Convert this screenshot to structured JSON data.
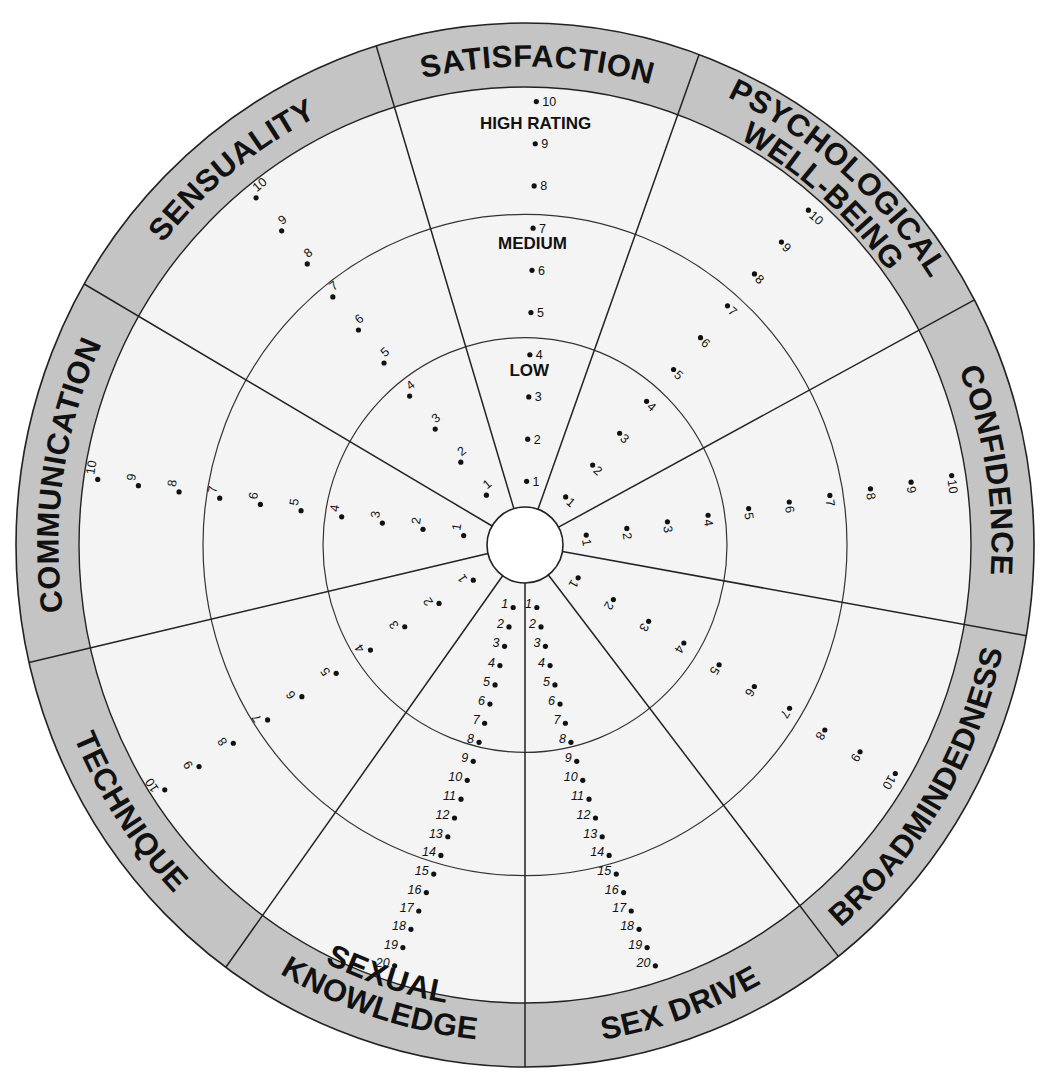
{
  "diagram": {
    "type": "rating-wheel",
    "center": {
      "x": 525,
      "y": 545
    },
    "outer_radius": {
      "rx": 509,
      "ry": 522
    },
    "band_inner_radius": {
      "rx": 446,
      "ry": 458
    },
    "level_radii": {
      "low_medium": 202,
      "medium_high": 322
    },
    "hub_radius": 38,
    "colors": {
      "band": "#c4c4c4",
      "face": "#f4f4f4",
      "lines": "#222222",
      "background": "#ffffff"
    },
    "level_labels": [
      {
        "text": "HIGH RATING",
        "sector": "satisfaction",
        "radius": 405
      },
      {
        "text": "MEDIUM",
        "sector": "satisfaction",
        "radius": 288
      },
      {
        "text": "LOW",
        "sector": "satisfaction",
        "radius": 165
      }
    ],
    "spokes_deg": [
      -17,
      20,
      62,
      100,
      142,
      180,
      216,
      257,
      300
    ],
    "categories": [
      {
        "id": "satisfaction",
        "label": "SATISFACTION",
        "start_deg": -17,
        "end_deg": 20,
        "scale_max": 10
      },
      {
        "id": "psychological-well-being",
        "label": "PSYCHOLOGICAL WELL-BEING",
        "label_lines": [
          "PSYCHOLOGICAL",
          "WELL-BEING"
        ],
        "start_deg": 20,
        "end_deg": 62,
        "scale_max": 10
      },
      {
        "id": "confidence",
        "label": "CONFIDENCE",
        "start_deg": 62,
        "end_deg": 100,
        "scale_max": 10
      },
      {
        "id": "broadmindedness",
        "label": "BROADMINDEDNESS",
        "start_deg": 100,
        "end_deg": 142,
        "scale_max": 10
      },
      {
        "id": "sex-drive",
        "label": "SEX DRIVE",
        "start_deg": 142,
        "end_deg": 180,
        "scale_max": 20
      },
      {
        "id": "sexual-knowledge",
        "label": "SEXUAL KNOWLEDGE",
        "label_lines": [
          "SEXUAL",
          "KNOWLEDGE"
        ],
        "start_deg": 180,
        "end_deg": 216,
        "scale_max": 20
      },
      {
        "id": "technique",
        "label": "TECHNIQUE",
        "start_deg": 216,
        "end_deg": 257,
        "scale_max": 10
      },
      {
        "id": "communication",
        "label": "COMMUNICATION",
        "start_deg": 257,
        "end_deg": 300,
        "scale_max": 10
      },
      {
        "id": "sensuality",
        "label": "SENSUALITY",
        "start_deg": 300,
        "end_deg": 343,
        "scale_max": 10
      }
    ],
    "scale_points_10": [
      1,
      2,
      3,
      4,
      5,
      6,
      7,
      8,
      9,
      10
    ],
    "scale_points_20": [
      1,
      2,
      3,
      4,
      5,
      6,
      7,
      8,
      9,
      10,
      11,
      12,
      13,
      14,
      15,
      16,
      17,
      18,
      19,
      20
    ]
  }
}
